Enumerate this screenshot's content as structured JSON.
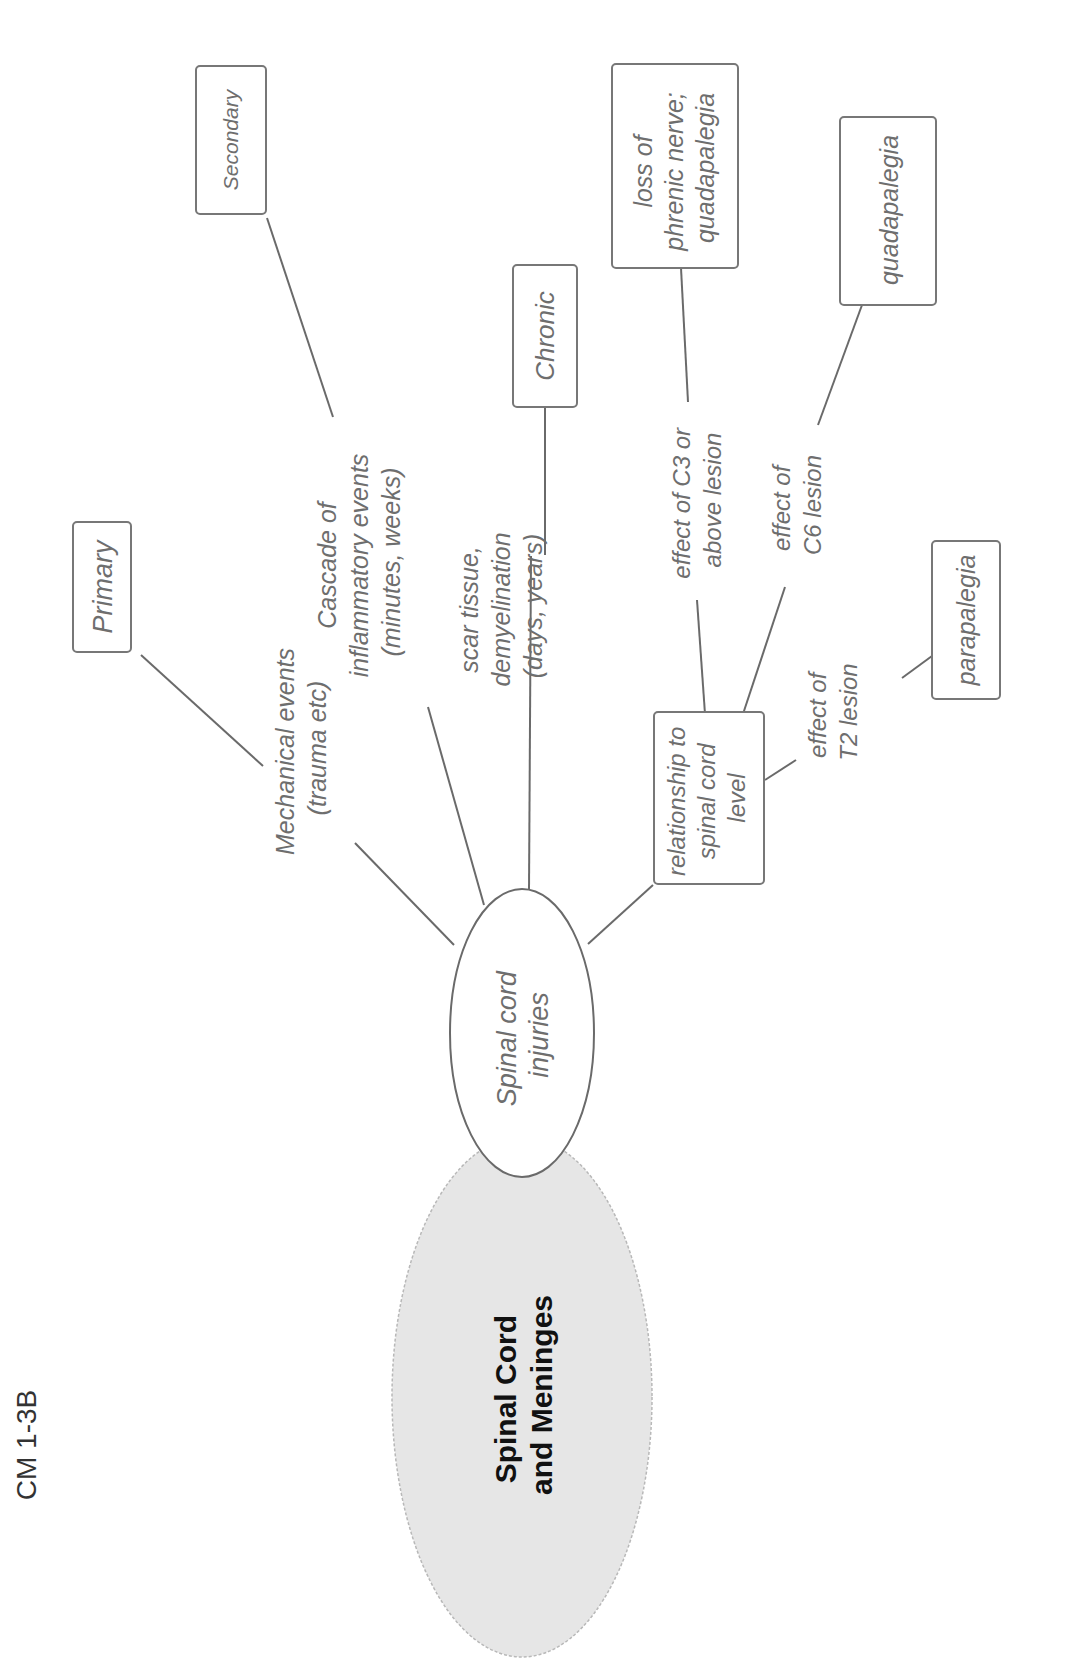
{
  "page_code": "CM 1-3B",
  "diagram": {
    "type": "mind-map",
    "orientation": "rotated 90° counter-clockwise",
    "colors": {
      "root_fill": "#e6e6e6",
      "line": "#6a6a6a",
      "text": "#6e6e6e",
      "root_text": "#111111"
    },
    "root": {
      "line1": "Spinal Cord",
      "line2": "and Meninges"
    },
    "hub": {
      "line1": "Spinal cord",
      "line2": "injuries"
    },
    "branches": {
      "mechanical": {
        "line1": "Mechanical events",
        "line2": "(trauma etc)"
      },
      "primary": {
        "label": "Primary"
      },
      "cascade": {
        "line1": "Cascade of",
        "line2": "inflammatory events",
        "line3": "(minutes, weeks)"
      },
      "secondary": {
        "label": "Secondary"
      },
      "scar": {
        "line1": "scar tissue,",
        "line2": "demyelination",
        "line3": "(days, years)"
      },
      "chronic": {
        "label": "Chronic"
      },
      "relationship": {
        "line1": "relationship to",
        "line2": "spinal cord",
        "line3": "level"
      },
      "c3": {
        "line1": "effect of C3 or",
        "line2": "above lesion"
      },
      "c3_result": {
        "line1": "loss of",
        "line2": "phrenic nerve;",
        "line3": "quadapalegia"
      },
      "c6": {
        "line1": "effect of",
        "line2": "C6 lesion"
      },
      "c6_result": {
        "label": "quadapalegia"
      },
      "t2": {
        "line1": "effect of",
        "line2": "T2 lesion"
      },
      "t2_result": {
        "label": "parapalegia"
      }
    }
  }
}
